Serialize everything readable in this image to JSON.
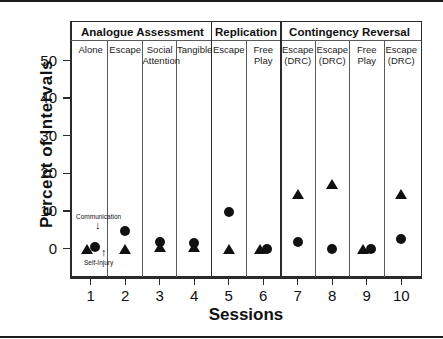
{
  "chart_data": {
    "type": "scatter",
    "title": "",
    "xlabel": "Sessions",
    "ylabel": "Percent  of  Intervals",
    "xlim": [
      0.4,
      10.6
    ],
    "ylim": [
      -5,
      55
    ],
    "grid": false,
    "legend_position": "inline-annotations",
    "x_ticks": [
      "1",
      "2",
      "3",
      "4",
      "5",
      "6",
      "7",
      "8",
      "9",
      "10"
    ],
    "y_ticks": [
      "0",
      "10",
      "20",
      "30",
      "40",
      "50"
    ],
    "y_tick_values": [
      0,
      10,
      20,
      30,
      40,
      50
    ],
    "x": [
      1,
      2,
      3,
      4,
      5,
      6,
      7,
      8,
      9,
      10
    ],
    "series": [
      {
        "name": "Communication",
        "marker": "circle",
        "color": "#111111",
        "values": [
          0.4,
          4.6,
          1.7,
          1.5,
          9.8,
          0.0,
          1.7,
          0.0,
          0.0,
          2.6
        ],
        "x_offsets": [
          0.12,
          0,
          0,
          0,
          0,
          0.1,
          0,
          0,
          0.12,
          0
        ]
      },
      {
        "name": "Self-Injury",
        "marker": "triangle",
        "color": "#111111",
        "values": [
          0.0,
          0.0,
          0.4,
          0.4,
          0.0,
          0.0,
          14.5,
          17.2,
          0.0,
          14.5
        ],
        "x_offsets": [
          -0.1,
          0,
          0,
          0,
          0,
          -0.1,
          0,
          0,
          -0.12,
          0
        ]
      }
    ],
    "annotations": [
      {
        "text": "Communication",
        "arrow": "↓",
        "target": "circle-series"
      },
      {
        "text": "Self-Injury",
        "arrow": "↑",
        "target": "triangle-series"
      }
    ],
    "phases": [
      {
        "label": "Analogue  Assessment",
        "start_session": 1,
        "end_session": 4
      },
      {
        "label": "Replication",
        "start_session": 5,
        "end_session": 6
      },
      {
        "label": "Contingency  Reversal",
        "start_session": 7,
        "end_session": 10
      }
    ],
    "conditions": [
      {
        "label": "Alone",
        "sessions": [
          1
        ]
      },
      {
        "label": "Escape",
        "sessions": [
          2
        ]
      },
      {
        "label": "Social\nAttention",
        "sessions": [
          3
        ]
      },
      {
        "label": "Tangible",
        "sessions": [
          4
        ]
      },
      {
        "label": "Escape",
        "sessions": [
          5
        ]
      },
      {
        "label": "Free\nPlay",
        "sessions": [
          6
        ]
      },
      {
        "label": "Escape\n(DRC)",
        "sessions": [
          7
        ]
      },
      {
        "label": "Escape\n(DRC)",
        "sessions": [
          8
        ]
      },
      {
        "label": "Free\nPlay",
        "sessions": [
          9
        ]
      },
      {
        "label": "Escape\n(DRC)",
        "sessions": [
          10
        ]
      }
    ]
  },
  "axis": {
    "ylabel": "Percent  of  Intervals",
    "xlabel": "Sessions",
    "yticks": [
      "50",
      "40",
      "30",
      "20",
      "10",
      "0"
    ],
    "xticks": [
      "1",
      "2",
      "3",
      "4",
      "5",
      "6",
      "7",
      "8",
      "9",
      "10"
    ]
  },
  "phase_headers": [
    {
      "label": "Analogue  Assessment"
    },
    {
      "label": "Replication"
    },
    {
      "label": "Contingency  Reversal"
    }
  ],
  "condition_headers": [
    {
      "line1": "Alone",
      "line2": ""
    },
    {
      "line1": "Escape",
      "line2": ""
    },
    {
      "line1": "Social",
      "line2": "Attention"
    },
    {
      "line1": "Tangible",
      "line2": ""
    },
    {
      "line1": "Escape",
      "line2": ""
    },
    {
      "line1": "Free",
      "line2": "Play"
    },
    {
      "line1": "Escape",
      "line2": "(DRC)"
    },
    {
      "line1": "Escape",
      "line2": "(DRC)"
    },
    {
      "line1": "Free",
      "line2": "Play"
    },
    {
      "line1": "Escape",
      "line2": "(DRC)"
    }
  ],
  "annotations": {
    "communication_label": "Communication",
    "communication_arrow": "↓",
    "selfinjury_label": "Self-Injury",
    "selfinjury_arrow": "↑"
  },
  "colors": {
    "marker": "#111111",
    "axis": "#2b2b2b",
    "divider": "#5a5a5a",
    "background": "#ffffff"
  }
}
